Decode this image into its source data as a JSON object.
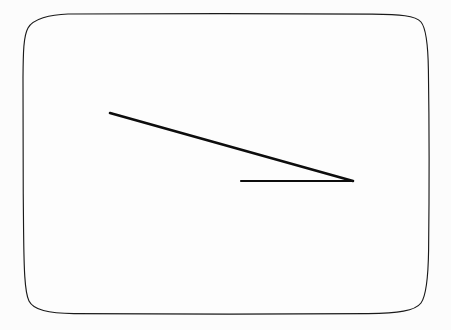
{
  "canvas": {
    "width": 451,
    "height": 330,
    "background_color": "#fcfcfc",
    "outer_background_color": "#ffffff"
  },
  "frame": {
    "shape_name": "rounded-rectangle",
    "stroke_color": "#1a1a1a",
    "fill_color": "#fdfdfd",
    "stroke_width": 1.15,
    "left": 23,
    "top": 14,
    "right": 429,
    "bottom": 314,
    "corner_radius": 45,
    "hand_drawn": true
  },
  "chart_data": {
    "type": "scatter",
    "title": "",
    "subtitle": "",
    "xlabel": "",
    "ylabel": "",
    "grid": false,
    "legend": null,
    "xlim": [
      0,
      451
    ],
    "ylim": [
      330,
      0
    ],
    "annotations": [],
    "tick_labels": {
      "x": [],
      "y": []
    },
    "series": [
      {
        "name": "diagonal-ray",
        "type": "line",
        "stroke_color": "#0d0d0d",
        "stroke_width": 2.6,
        "x": [
          110,
          353
        ],
        "y": [
          113,
          181
        ]
      },
      {
        "name": "horizontal-ray",
        "type": "line",
        "stroke_color": "#0d0d0d",
        "stroke_width": 2.1,
        "x": [
          241,
          353
        ],
        "y": [
          181,
          181
        ]
      }
    ],
    "vertex": {
      "label": "",
      "x": 353,
      "y": 181
    }
  },
  "figure": {
    "vertex_x": 353,
    "vertex_y": 181,
    "diagonal_start_x": 110,
    "diagonal_start_y": 113,
    "horizontal_start_x": 241,
    "horizontal_start_y": 181,
    "line_color": "#0d0d0d"
  }
}
